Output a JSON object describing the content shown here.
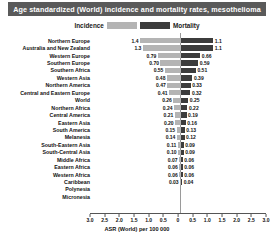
{
  "chart_data": {
    "type": "bar",
    "subtype": "diverging-population-pyramid",
    "title": "Age standardized (World) incidence and mortality rates, mesothelioma",
    "xlabel": "ASR (World) per 100 000",
    "ylabel": "",
    "xlim": [
      -3.0,
      3.0
    ],
    "grid": false,
    "legend_position": "top-center",
    "legend": [
      "Incidence",
      "Mortality"
    ],
    "colors": {
      "incidence": "#b4b4b4",
      "mortality": "#3c3c3c",
      "title_bg": "#5a5a5a",
      "title_fg": "#ffffff"
    },
    "axis_ticks": [
      "3.0",
      "2.5",
      "2.0",
      "1.5",
      "1.0",
      "0.5",
      "0",
      "0.5",
      "1.0",
      "1.5",
      "2.0",
      "2.5",
      "3.0"
    ],
    "axis_tick_values": [
      -3.0,
      -2.5,
      -2.0,
      -1.5,
      -1.0,
      -0.5,
      0,
      0.5,
      1.0,
      1.5,
      2.0,
      2.5,
      3.0
    ],
    "categories": [
      "Northern Europe",
      "Australia and New Zealand",
      "Western Europe",
      "Southern Europe",
      "Southern Africa",
      "Western Asia",
      "Northern America",
      "Central and Eastern Europe",
      "World",
      "Northern Africa",
      "Central America",
      "Eastern Asia",
      "South America",
      "Melanesia",
      "South-Eastern Asia",
      "South-Central Asia",
      "Middle Africa",
      "Eastern Africa",
      "Western Africa",
      "Caribbean",
      "Polynesia",
      "Micronesia"
    ],
    "series": [
      {
        "name": "Incidence",
        "values": [
          1.4,
          1.3,
          0.79,
          0.7,
          0.55,
          0.48,
          0.47,
          0.41,
          0.26,
          0.24,
          0.21,
          0.2,
          0.15,
          0.14,
          0.11,
          0.1,
          0.07,
          0.06,
          0.06,
          0.03,
          null,
          null
        ],
        "labels": [
          "1.4",
          "1.3",
          "0.79",
          "0.70",
          "0.55",
          "0.48",
          "0.47",
          "0.41",
          "0.26",
          "0.24",
          "0.21",
          "0.20",
          "0.15",
          "0.14",
          "0.11",
          "0.10",
          "0.07",
          "0.06",
          "0.06",
          "0.03",
          "",
          ""
        ]
      },
      {
        "name": "Mortality",
        "values": [
          1.1,
          1.1,
          0.66,
          0.59,
          0.51,
          0.39,
          0.33,
          0.32,
          0.25,
          0.22,
          0.19,
          0.16,
          0.13,
          0.12,
          0.09,
          0.09,
          0.06,
          0.06,
          0.06,
          0.04,
          null,
          null
        ],
        "labels": [
          "1.1",
          "1.1",
          "0.66",
          "0.59",
          "0.51",
          "0.39",
          "0.33",
          "0.32",
          "0.25",
          "0.22",
          "0.19",
          "0.16",
          "0.13",
          "0.12",
          "0.09",
          "0.09",
          "0.06",
          "0.06",
          "0.06",
          "0.04",
          "",
          ""
        ]
      }
    ]
  }
}
